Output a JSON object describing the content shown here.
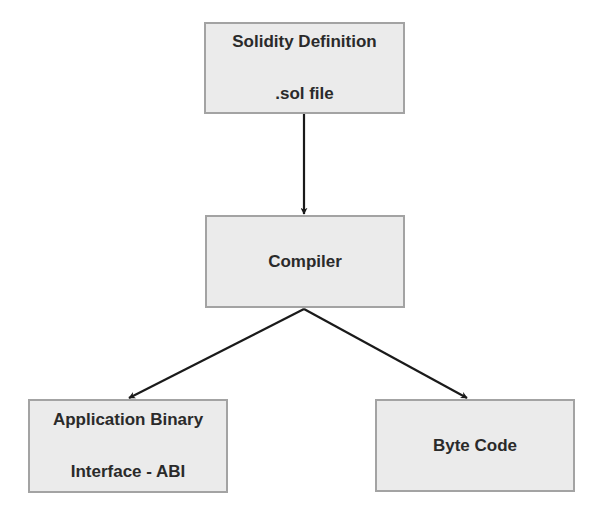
{
  "diagram": {
    "type": "flowchart",
    "colors": {
      "node_fill": "#ebebeb",
      "node_border": "#a3a3a3",
      "text": "#2a2a2a",
      "edge": "#1a1a1a"
    },
    "nodes": {
      "solidity": {
        "line1": "Solidity Definition",
        "line2": ".sol file"
      },
      "compiler": {
        "line1": "Compiler"
      },
      "abi": {
        "line1": "Application Binary",
        "line2": "Interface - ABI"
      },
      "bytecode": {
        "line1": "Byte Code"
      }
    },
    "edges": [
      {
        "from": "solidity",
        "to": "compiler"
      },
      {
        "from": "compiler",
        "to": "abi"
      },
      {
        "from": "compiler",
        "to": "bytecode"
      }
    ]
  }
}
